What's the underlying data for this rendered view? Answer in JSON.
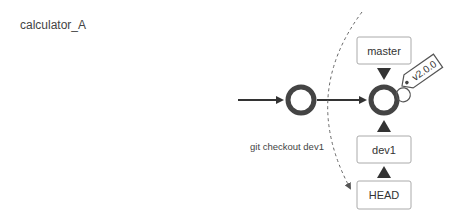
{
  "title": "calculator_A",
  "diagram": {
    "commits": [
      {
        "id": "commit-1"
      },
      {
        "id": "commit-2"
      }
    ],
    "refs": {
      "master": "master",
      "dev1": "dev1",
      "head": "HEAD"
    },
    "tag": "v2.0.0",
    "command": "git checkout dev1"
  },
  "colors": {
    "node": "#444444",
    "box_border": "#999999",
    "text": "#333333"
  }
}
